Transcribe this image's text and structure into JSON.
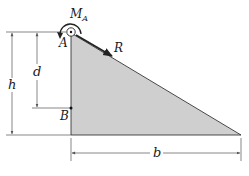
{
  "diagram": {
    "labels": {
      "moment": "M",
      "moment_sub": "A",
      "point_a": "A",
      "point_b": "B",
      "force": "R",
      "height": "h",
      "depth": "d",
      "base": "b"
    },
    "colors": {
      "fill": "#cfcfcf",
      "stroke": "#222222",
      "dim_line": "#555555"
    }
  }
}
